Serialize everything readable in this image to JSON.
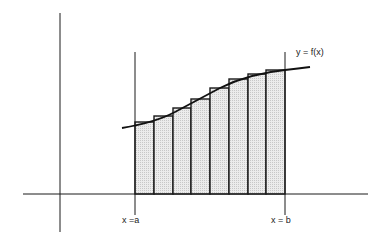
{
  "diagram": {
    "curve_label": "y = f(x)",
    "left_bound_label": "x =a",
    "right_bound_label": "x = b",
    "num_rectangles": 8,
    "fill_color": "#e4e4e4",
    "stroke_color": "#1a1a1a"
  }
}
